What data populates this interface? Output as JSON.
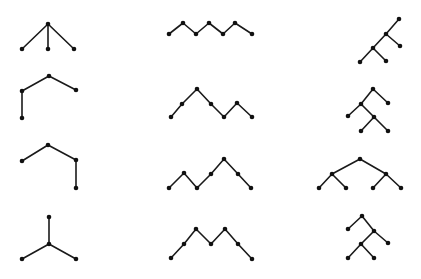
{
  "diagram": {
    "width": 421,
    "height": 279,
    "background": "#ffffff",
    "edge_color": "#1a1a1a",
    "node_color": "#111111",
    "node_radius": 2.3,
    "trees": [
      {
        "id": "tree-r1-c1",
        "nodes": [
          [
            48,
            24
          ],
          [
            22,
            49
          ],
          [
            48,
            49
          ],
          [
            74,
            49
          ]
        ],
        "edges": [
          [
            0,
            1
          ],
          [
            0,
            2
          ],
          [
            0,
            3
          ]
        ]
      },
      {
        "id": "tree-r2-c1",
        "nodes": [
          [
            49,
            76
          ],
          [
            22,
            91
          ],
          [
            76,
            90
          ],
          [
            22,
            118
          ]
        ],
        "edges": [
          [
            0,
            1
          ],
          [
            0,
            2
          ],
          [
            1,
            3
          ]
        ]
      },
      {
        "id": "tree-r3-c1",
        "nodes": [
          [
            48,
            145
          ],
          [
            22,
            161
          ],
          [
            76,
            160
          ],
          [
            76,
            188
          ]
        ],
        "edges": [
          [
            0,
            1
          ],
          [
            0,
            2
          ],
          [
            2,
            3
          ]
        ]
      },
      {
        "id": "tree-r4-c1",
        "nodes": [
          [
            49,
            217
          ],
          [
            49,
            244
          ],
          [
            22,
            259
          ],
          [
            76,
            259
          ]
        ],
        "edges": [
          [
            0,
            1
          ],
          [
            1,
            2
          ],
          [
            1,
            3
          ]
        ]
      },
      {
        "id": "tree-r1-c2",
        "nodes": [
          [
            169,
            34
          ],
          [
            183,
            23
          ],
          [
            196,
            34
          ],
          [
            209,
            23
          ],
          [
            223,
            34
          ],
          [
            235,
            23
          ],
          [
            252,
            34
          ]
        ],
        "edges": [
          [
            0,
            1
          ],
          [
            1,
            2
          ],
          [
            2,
            3
          ],
          [
            3,
            4
          ],
          [
            4,
            5
          ],
          [
            5,
            6
          ]
        ]
      },
      {
        "id": "tree-r2-c2",
        "nodes": [
          [
            171,
            117
          ],
          [
            182,
            104
          ],
          [
            197,
            89
          ],
          [
            211,
            104
          ],
          [
            224,
            117
          ],
          [
            237,
            103
          ],
          [
            252,
            117
          ]
        ],
        "edges": [
          [
            0,
            1
          ],
          [
            1,
            2
          ],
          [
            2,
            3
          ],
          [
            3,
            4
          ],
          [
            4,
            5
          ],
          [
            5,
            6
          ]
        ]
      },
      {
        "id": "tree-r3-c2",
        "nodes": [
          [
            169,
            188
          ],
          [
            184,
            173
          ],
          [
            197,
            188
          ],
          [
            211,
            174
          ],
          [
            224,
            159
          ],
          [
            238,
            174
          ],
          [
            251,
            188
          ]
        ],
        "edges": [
          [
            0,
            1
          ],
          [
            1,
            2
          ],
          [
            2,
            3
          ],
          [
            3,
            4
          ],
          [
            4,
            5
          ],
          [
            5,
            6
          ]
        ]
      },
      {
        "id": "tree-r4-c2",
        "nodes": [
          [
            171,
            258
          ],
          [
            184,
            244
          ],
          [
            196,
            229
          ],
          [
            211,
            244
          ],
          [
            225,
            229
          ],
          [
            238,
            244
          ],
          [
            252,
            259
          ]
        ],
        "edges": [
          [
            0,
            1
          ],
          [
            1,
            2
          ],
          [
            2,
            3
          ],
          [
            3,
            4
          ],
          [
            4,
            5
          ],
          [
            5,
            6
          ]
        ]
      },
      {
        "id": "tree-r1-c3",
        "nodes": [
          [
            399,
            19
          ],
          [
            386,
            34
          ],
          [
            400,
            46
          ],
          [
            373,
            48
          ],
          [
            386,
            61
          ],
          [
            360,
            62
          ]
        ],
        "edges": [
          [
            0,
            1
          ],
          [
            1,
            2
          ],
          [
            1,
            3
          ],
          [
            3,
            4
          ],
          [
            3,
            5
          ]
        ]
      },
      {
        "id": "tree-r2-c3",
        "nodes": [
          [
            373,
            89
          ],
          [
            388,
            103
          ],
          [
            361,
            104
          ],
          [
            348,
            116
          ],
          [
            374,
            117
          ],
          [
            361,
            131
          ],
          [
            388,
            131
          ]
        ],
        "edges": [
          [
            0,
            1
          ],
          [
            0,
            2
          ],
          [
            2,
            3
          ],
          [
            2,
            4
          ],
          [
            4,
            5
          ],
          [
            4,
            6
          ]
        ]
      },
      {
        "id": "tree-r3-c3",
        "nodes": [
          [
            360,
            159
          ],
          [
            332,
            174
          ],
          [
            386,
            174
          ],
          [
            319,
            188
          ],
          [
            346,
            188
          ],
          [
            373,
            188
          ],
          [
            401,
            188
          ]
        ],
        "edges": [
          [
            0,
            1
          ],
          [
            0,
            2
          ],
          [
            1,
            3
          ],
          [
            1,
            4
          ],
          [
            2,
            5
          ],
          [
            2,
            6
          ]
        ]
      },
      {
        "id": "tree-r4-c3",
        "nodes": [
          [
            362,
            216
          ],
          [
            348,
            229
          ],
          [
            374,
            231
          ],
          [
            388,
            243
          ],
          [
            361,
            244
          ],
          [
            348,
            258
          ],
          [
            374,
            258
          ]
        ],
        "edges": [
          [
            0,
            1
          ],
          [
            0,
            2
          ],
          [
            2,
            3
          ],
          [
            2,
            4
          ],
          [
            4,
            5
          ],
          [
            4,
            6
          ]
        ]
      }
    ]
  }
}
